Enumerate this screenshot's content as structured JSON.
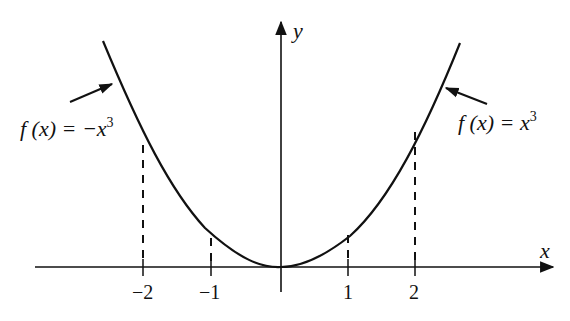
{
  "figure": {
    "axes": {
      "x_label": "x",
      "y_label": "y",
      "tick_labels": [
        "−2",
        "−1",
        "1",
        "2"
      ],
      "tick_values": [
        -2,
        -1,
        1,
        2
      ]
    },
    "curves": [
      {
        "name": "left-branch",
        "label_prefix": "f (x) = ",
        "label_expr": "−x",
        "label_exp": "3",
        "domain": "x ≤ 0"
      },
      {
        "name": "right-branch",
        "label_prefix": "f (x) = ",
        "label_expr": "x",
        "label_exp": "3",
        "domain": "x ≥ 0"
      }
    ],
    "guides": {
      "style": "dashed",
      "at_x": [
        -2,
        -1,
        1,
        2
      ]
    },
    "colors": {
      "ink": "#111111",
      "background": "#ffffff"
    }
  }
}
